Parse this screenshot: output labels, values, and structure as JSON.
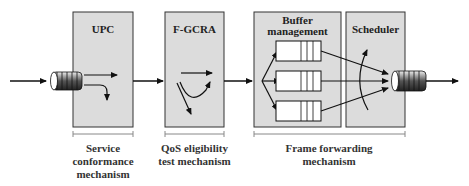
{
  "diagram": {
    "blocks": [
      {
        "id": "upc",
        "title": "UPC"
      },
      {
        "id": "fgcra",
        "title": "F-GCRA"
      },
      {
        "id": "buffer",
        "title_line1": "Buffer",
        "title_line2": "management"
      },
      {
        "id": "scheduler",
        "title": "Scheduler"
      }
    ],
    "captions": [
      {
        "id": "service",
        "lines": [
          "Service",
          "conformance",
          "mechanism"
        ]
      },
      {
        "id": "qos",
        "lines": [
          "QoS eligibility",
          "test mechanism"
        ]
      },
      {
        "id": "forwarding",
        "lines": [
          "Frame forwarding",
          "mechanism"
        ]
      }
    ],
    "colors": {
      "block_fill": "#dcdcdc",
      "block_stroke": "#333333",
      "arrow": "#111111",
      "bracket": "#888888"
    }
  }
}
